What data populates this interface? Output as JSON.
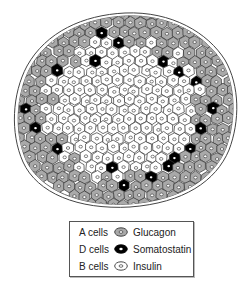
{
  "figure": {
    "colors": {
      "a_cell_fill": "#a9a9a9",
      "d_cell_fill": "#000000",
      "b_cell_fill": "#ffffff",
      "outline": "#333333"
    }
  },
  "legend": {
    "items": [
      {
        "cell": "A cells",
        "hormone": "Glucagon",
        "swatch": "gray-cell-icon"
      },
      {
        "cell": "D cells",
        "hormone": "Somatostatin",
        "swatch": "black-cell-icon"
      },
      {
        "cell": "B cells",
        "hormone": "Insulin",
        "swatch": "white-cell-icon"
      }
    ]
  }
}
